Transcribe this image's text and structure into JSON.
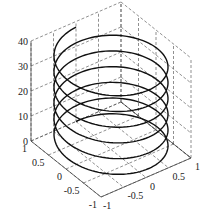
{
  "chart_data": {
    "type": "line",
    "subtype": "3d-helix",
    "title": "",
    "xlabel": "",
    "ylabel": "",
    "zlabel": "",
    "x_ticks": [
      "-1",
      "-0.5",
      "0",
      "0.5",
      "1"
    ],
    "y_ticks": [
      "1",
      "0.5",
      "0",
      "-0.5",
      "-1"
    ],
    "z_ticks": [
      "0",
      "10",
      "20",
      "30",
      "40"
    ],
    "xlim": [
      -1,
      1
    ],
    "ylim": [
      -1,
      1
    ],
    "zlim": [
      0,
      40
    ],
    "grid": true,
    "grid_style": "dashed",
    "series": [
      {
        "name": "helix",
        "equation": "x = sin(t), y = cos(t), z = t",
        "t_range": [
          0,
          37.7
        ],
        "turns": 6,
        "color": "#111111"
      }
    ]
  }
}
